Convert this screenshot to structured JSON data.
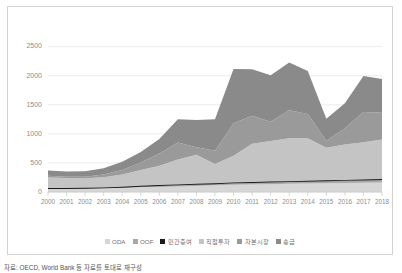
{
  "caption": "자료: OECD, World Bank 등 자료를 토대로 재구성",
  "legend": {
    "position": "bottom-center",
    "items": [
      {
        "label": "ODA",
        "color": "#d6d6d6",
        "marker": "square"
      },
      {
        "label": "OOF",
        "color": "#a8a8a8",
        "marker": "square"
      },
      {
        "label": "민간증여",
        "color": "#1a1a1a",
        "marker": "square"
      },
      {
        "label": "직접투자",
        "color": "#c4c4c4",
        "marker": "square"
      },
      {
        "label": "자본시장",
        "color": "#9a9a9a",
        "marker": "square"
      },
      {
        "label": "송금",
        "color": "#8a8a8a",
        "marker": "square"
      }
    ]
  },
  "chart_data": {
    "type": "area",
    "stacked": true,
    "title": "",
    "xlabel": "",
    "ylabel": "",
    "grid": true,
    "ylim": [
      0,
      2700
    ],
    "yticks": [
      0,
      500,
      1000,
      1500,
      2000,
      2500
    ],
    "categories": [
      "2000",
      "2001",
      "2002",
      "2003",
      "2004",
      "2005",
      "2006",
      "2007",
      "2008",
      "2009",
      "2010",
      "2011",
      "2012",
      "2013",
      "2014",
      "2015",
      "2016",
      "2017",
      "2018"
    ],
    "series": [
      {
        "name": "ODA",
        "color": "#d6d6d6",
        "values": [
          55,
          55,
          58,
          62,
          70,
          80,
          88,
          95,
          105,
          115,
          125,
          130,
          135,
          140,
          145,
          150,
          155,
          160,
          165
        ]
      },
      {
        "name": "OOF",
        "color": "#a8a8a8",
        "values": [
          8,
          8,
          9,
          10,
          12,
          18,
          22,
          25,
          25,
          25,
          28,
          30,
          32,
          34,
          36,
          38,
          40,
          42,
          45
        ]
      },
      {
        "name": "민간증여",
        "color": "#1a1a1a",
        "values": [
          6,
          6,
          6,
          7,
          8,
          9,
          10,
          10,
          10,
          10,
          11,
          11,
          12,
          12,
          12,
          12,
          12,
          12,
          12
        ]
      },
      {
        "name": "직접투자",
        "color": "#c4c4c4",
        "values": [
          180,
          170,
          165,
          175,
          210,
          270,
          330,
          430,
          500,
          330,
          460,
          660,
          700,
          740,
          730,
          560,
          610,
          640,
          680
        ]
      },
      {
        "name": "자본시장",
        "color": "#9a9a9a",
        "values": [
          30,
          25,
          25,
          45,
          80,
          130,
          210,
          290,
          130,
          230,
          560,
          480,
          330,
          480,
          420,
          120,
          280,
          520,
          460
        ]
      },
      {
        "name": "송금",
        "color": "#8a8a8a",
        "values": [
          90,
          90,
          95,
          110,
          140,
          180,
          250,
          400,
          470,
          540,
          930,
          800,
          800,
          820,
          740,
          380,
          430,
          620,
          580
        ]
      }
    ],
    "totals": [
      369,
      354,
      358,
      409,
      520,
      687,
      910,
      1250,
      1240,
      1250,
      2114,
      2111,
      2009,
      2226,
      2083,
      1260,
      1527,
      1994,
      1942
    ]
  }
}
